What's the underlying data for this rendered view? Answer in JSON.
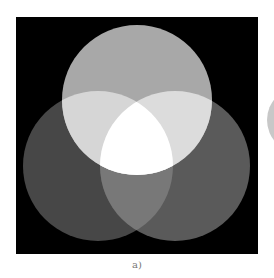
{
  "top_strip": {
    "text": ""
  },
  "figure": {
    "background": "#000000",
    "frame": {
      "x": 16,
      "y": 17,
      "width": 242,
      "height": 237
    },
    "circles": [
      {
        "name": "top",
        "cx": 137,
        "cy": 100,
        "r": 75,
        "color": "#a8a8a8"
      },
      {
        "name": "bottom-left",
        "cx": 98,
        "cy": 166,
        "r": 75,
        "color": "#474747"
      },
      {
        "name": "bottom-right",
        "cx": 175,
        "cy": 166,
        "r": 75,
        "color": "#5a5a5a"
      }
    ],
    "overlaps": {
      "top_left": "#d6d6d6",
      "top_right": "#dcdcdc",
      "bottom_pair": "#787878",
      "center": "#ffffff"
    },
    "partial_circle_right": {
      "cx": 300,
      "cy": 120,
      "r": 33,
      "color": "#c8c8c8"
    }
  },
  "caption": "a)"
}
